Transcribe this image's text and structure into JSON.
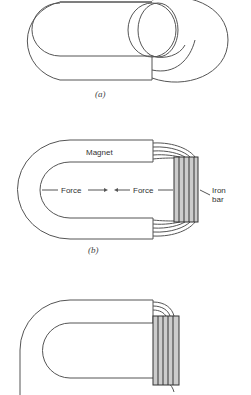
{
  "figure": {
    "panels": [
      {
        "id": "a",
        "caption": "(a)",
        "description": "Horseshoe magnet with closed flux loops across the gap"
      },
      {
        "id": "b",
        "caption": "(b)",
        "labels": {
          "magnet": "Magnet",
          "force_left": "Force",
          "force_right": "Force",
          "iron_bar_line1": "Iron",
          "iron_bar_line2": "bar"
        }
      },
      {
        "id": "c",
        "caption": "",
        "description": "Horseshoe magnet with iron bar attached at poles"
      }
    ],
    "colors": {
      "stroke": "#555555",
      "bar_fill": "#cccccc",
      "text": "#333333"
    }
  }
}
